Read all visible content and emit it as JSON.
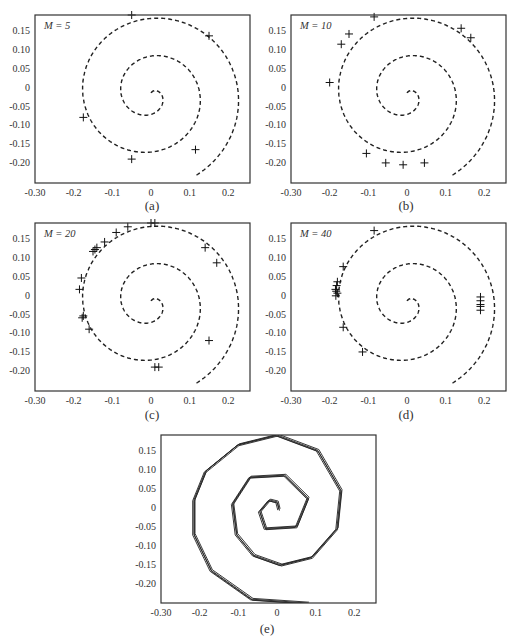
{
  "figure": {
    "panels": [
      {
        "id": "a",
        "caption": "(a)",
        "label": "M = 5"
      },
      {
        "id": "b",
        "caption": "(b)",
        "label": "M = 10"
      },
      {
        "id": "c",
        "caption": "(c)",
        "label": "M = 20"
      },
      {
        "id": "d",
        "caption": "(d)",
        "label": "M = 40"
      },
      {
        "id": "e",
        "caption": "(e)",
        "label": ""
      }
    ],
    "x_ticks": [
      "-0.30",
      "-0.2",
      "-0.1",
      "0",
      "0.1",
      "0.2"
    ],
    "y_ticks": [
      "0.15",
      "0.10",
      "0.05",
      "0",
      "-0.05",
      "-0.10",
      "-0.15",
      "-0.20"
    ]
  },
  "chart_data": [
    {
      "type": "scatter",
      "title": "M = 5",
      "caption": "(a)",
      "xlim": [
        -0.3,
        0.256
      ],
      "ylim": [
        -0.253,
        0.19
      ],
      "x_ticks": [
        -0.3,
        -0.2,
        -0.1,
        0,
        0.1,
        0.2
      ],
      "y_ticks": [
        0.15,
        0.1,
        0.05,
        0,
        -0.05,
        -0.1,
        -0.15,
        -0.2
      ],
      "reference_curve": "dashed spiral",
      "points": [
        [
          -0.05,
          0.19
        ],
        [
          0.15,
          0.135
        ],
        [
          -0.175,
          -0.08
        ],
        [
          0.115,
          -0.165
        ],
        [
          -0.05,
          -0.19
        ]
      ]
    },
    {
      "type": "scatter",
      "title": "M = 10",
      "caption": "(b)",
      "xlim": [
        -0.3,
        0.256
      ],
      "ylim": [
        -0.253,
        0.19
      ],
      "x_ticks": [
        -0.3,
        -0.2,
        -0.1,
        0,
        0.1,
        0.2
      ],
      "y_ticks": [
        0.15,
        0.1,
        0.05,
        0,
        -0.05,
        -0.1,
        -0.15,
        -0.2
      ],
      "reference_curve": "dashed spiral",
      "points": [
        [
          -0.085,
          0.185
        ],
        [
          -0.15,
          0.14
        ],
        [
          -0.17,
          0.113
        ],
        [
          -0.2,
          0.012
        ],
        [
          0.14,
          0.155
        ],
        [
          0.165,
          0.13
        ],
        [
          -0.105,
          -0.175
        ],
        [
          -0.055,
          -0.2
        ],
        [
          -0.01,
          -0.205
        ],
        [
          0.045,
          -0.2
        ]
      ]
    },
    {
      "type": "scatter",
      "title": "M = 20",
      "caption": "(c)",
      "xlim": [
        -0.3,
        0.256
      ],
      "ylim": [
        -0.253,
        0.19
      ],
      "x_ticks": [
        -0.3,
        -0.2,
        -0.1,
        0,
        0.1,
        0.2
      ],
      "y_ticks": [
        0.15,
        0.1,
        0.05,
        0,
        -0.05,
        -0.1,
        -0.15,
        -0.2
      ],
      "reference_curve": "dashed spiral",
      "points": [
        [
          -0.06,
          0.18
        ],
        [
          0,
          0.19
        ],
        [
          0.01,
          0.19
        ],
        [
          -0.09,
          0.165
        ],
        [
          -0.12,
          0.14
        ],
        [
          -0.14,
          0.125
        ],
        [
          -0.145,
          0.12
        ],
        [
          -0.15,
          0.115
        ],
        [
          0.14,
          0.125
        ],
        [
          0.17,
          0.085
        ],
        [
          -0.18,
          0.045
        ],
        [
          -0.185,
          0.015
        ],
        [
          -0.175,
          -0.055
        ],
        [
          -0.178,
          -0.06
        ],
        [
          -0.16,
          -0.09
        ],
        [
          0.15,
          -0.12
        ],
        [
          0.01,
          -0.19
        ],
        [
          0.02,
          -0.19
        ]
      ]
    },
    {
      "type": "scatter",
      "title": "M = 40",
      "caption": "(d)",
      "xlim": [
        -0.3,
        0.256
      ],
      "ylim": [
        -0.253,
        0.19
      ],
      "x_ticks": [
        -0.3,
        -0.2,
        -0.1,
        0,
        0.1,
        0.2
      ],
      "y_ticks": [
        0.15,
        0.1,
        0.05,
        0,
        -0.05,
        -0.1,
        -0.15,
        -0.2
      ],
      "reference_curve": "dashed spiral",
      "points": [
        [
          -0.085,
          0.17
        ],
        [
          -0.165,
          0.075
        ],
        [
          -0.18,
          0.035
        ],
        [
          -0.182,
          0.025
        ],
        [
          -0.185,
          0.015
        ],
        [
          -0.183,
          0.01
        ],
        [
          -0.18,
          0.005
        ],
        [
          -0.184,
          -0.002
        ],
        [
          -0.165,
          -0.085
        ],
        [
          -0.115,
          -0.15
        ],
        [
          0.19,
          -0.005
        ],
        [
          0.19,
          -0.015
        ],
        [
          0.19,
          -0.025
        ],
        [
          0.19,
          -0.03
        ],
        [
          0.19,
          -0.04
        ]
      ]
    },
    {
      "type": "line",
      "title": "",
      "caption": "(e)",
      "xlim": [
        -0.3,
        0.256
      ],
      "ylim": [
        -0.25,
        0.19
      ],
      "x_ticks": [
        -0.3,
        -0.2,
        -0.1,
        0,
        0.1,
        0.2
      ],
      "y_ticks": [
        0.15,
        0.1,
        0.05,
        0,
        -0.05,
        -0.1,
        -0.15,
        -0.2
      ],
      "description": "polygonal spiral trajectories (multiple overlaid runs)",
      "polyline": [
        [
          0.005,
          -0.005
        ],
        [
          0.0,
          0.015
        ],
        [
          -0.02,
          0.02
        ],
        [
          -0.045,
          -0.01
        ],
        [
          -0.03,
          -0.055
        ],
        [
          0.05,
          -0.05
        ],
        [
          0.08,
          0.025
        ],
        [
          0.02,
          0.085
        ],
        [
          -0.07,
          0.08
        ],
        [
          -0.115,
          0.01
        ],
        [
          -0.105,
          -0.07
        ],
        [
          -0.06,
          -0.125
        ],
        [
          0.01,
          -0.15
        ],
        [
          0.09,
          -0.13
        ],
        [
          0.155,
          -0.055
        ],
        [
          0.165,
          0.045
        ],
        [
          0.105,
          0.15
        ],
        [
          0.0,
          0.19
        ],
        [
          -0.1,
          0.165
        ],
        [
          -0.185,
          0.095
        ],
        [
          -0.215,
          0.02
        ],
        [
          -0.215,
          -0.07
        ],
        [
          -0.17,
          -0.165
        ],
        [
          -0.065,
          -0.24
        ],
        [
          0.08,
          -0.25
        ]
      ]
    }
  ]
}
